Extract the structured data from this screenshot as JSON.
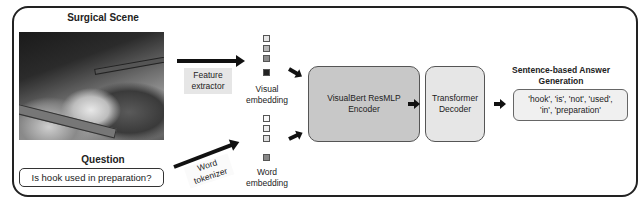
{
  "diagram": {
    "surgical_scene": {
      "title": "Surgical Scene",
      "image_description": "grayscale laparoscopic surgical image with instruments"
    },
    "question": {
      "title": "Question",
      "text": "Is hook used in preparation?"
    },
    "feature_extractor": {
      "label_line1": "Feature",
      "label_line2": "extractor"
    },
    "word_tokenizer": {
      "label_line1": "Word",
      "label_line2": "tokenizer"
    },
    "visual_embedding": {
      "label_line1": "Visual",
      "label_line2": "embedding",
      "squares": [
        "#e6e6e6",
        "#b8b8b8",
        "#8c8c8c",
        "#222222"
      ]
    },
    "word_embedding": {
      "label_line1": "Word",
      "label_line2": "embedding",
      "squares": [
        "#f8f8f8",
        "#eeeeee",
        "#dedede",
        "#888888"
      ]
    },
    "encoder": {
      "label_line1": "VisualBert ResMLP",
      "label_line2": "Encoder"
    },
    "decoder": {
      "label_line1": "Transformer",
      "label_line2": "Decoder"
    },
    "answer": {
      "title_line1": "Sentence-based Answer",
      "title_line2": "Generation",
      "text_line1": "'hook', 'is', 'not', 'used',",
      "text_line2": "'in', 'preparation'"
    }
  }
}
